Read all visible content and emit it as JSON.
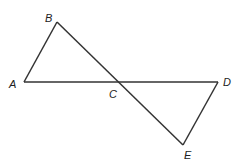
{
  "diagram": {
    "points": [
      {
        "name": "A",
        "x": 24,
        "y": 82,
        "lx": 9,
        "ly": 88
      },
      {
        "name": "B",
        "x": 57,
        "y": 22,
        "lx": 45,
        "ly": 22
      },
      {
        "name": "C",
        "x": 117,
        "y": 82,
        "lx": 109,
        "ly": 98
      },
      {
        "name": "D",
        "x": 218,
        "y": 82,
        "lx": 223,
        "ly": 86
      },
      {
        "name": "E",
        "x": 183,
        "y": 145,
        "lx": 184,
        "ly": 159
      }
    ],
    "segments": [
      [
        "A",
        "B"
      ],
      [
        "B",
        "E"
      ],
      [
        "A",
        "D"
      ],
      [
        "D",
        "E"
      ]
    ],
    "labels": {
      "A": "A",
      "B": "B",
      "C": "C",
      "D": "D",
      "E": "E"
    }
  }
}
